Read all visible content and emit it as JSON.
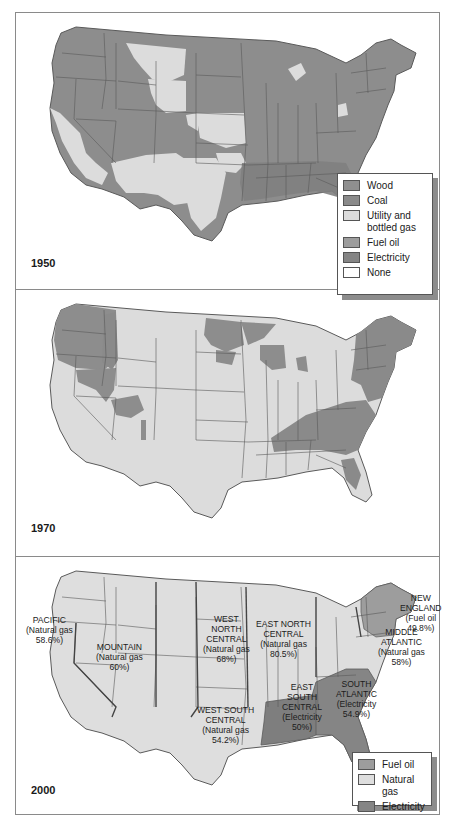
{
  "colors": {
    "wood": "#8f8f8f",
    "coal": "#8a8a8a",
    "utility_bottled_gas": "#dcdcdc",
    "fuel_oil": "#9d9d9d",
    "electricity": "#858585",
    "none": "#ffffff",
    "natural_gas": "#dedede",
    "border": "#5a5a5a"
  },
  "panels": [
    {
      "year": "1950",
      "legend": [
        {
          "label": "Wood",
          "key": "wood"
        },
        {
          "label": "Coal",
          "key": "coal"
        },
        {
          "label": "Utility and bottled gas",
          "key": "utility_bottled_gas"
        },
        {
          "label": "Fuel oil",
          "key": "fuel_oil"
        },
        {
          "label": "Electricity",
          "key": "electricity"
        },
        {
          "label": "None",
          "key": "none"
        }
      ]
    },
    {
      "year": "1970"
    },
    {
      "year": "2000",
      "legend": [
        {
          "label": "Fuel oil",
          "key": "fuel_oil"
        },
        {
          "label": "Natural gas",
          "key": "natural_gas"
        },
        {
          "label": "Electricity",
          "key": "electricity"
        }
      ],
      "regions": [
        {
          "name": "PACIFIC",
          "fuel": "(Natural gas",
          "share": "58.6%)"
        },
        {
          "name": "MOUNTAIN",
          "fuel": "(Natural gas",
          "share": "60%)"
        },
        {
          "name_lines": [
            "WEST",
            "NORTH",
            "CENTRAL"
          ],
          "fuel": "(Natural gas",
          "share": "68%)"
        },
        {
          "name_lines": [
            "EAST NORTH",
            "CENTRAL"
          ],
          "fuel": "(Natural gas",
          "share": "80.5%)"
        },
        {
          "name_lines": [
            "NEW",
            "ENGLAND"
          ],
          "fuel": "(Fuel oil",
          "share": "49.8%)"
        },
        {
          "name_lines": [
            "MIDDLE",
            "ATLANTIC"
          ],
          "fuel": "(Natural gas",
          "share": "58%)"
        },
        {
          "name_lines": [
            "WEST SOUTH",
            "CENTRAL"
          ],
          "fuel": "(Natural gas",
          "share": "54.2%)"
        },
        {
          "name_lines": [
            "EAST",
            "SOUTH",
            "CENTRAL"
          ],
          "fuel": "(Electricity",
          "share": "50%)"
        },
        {
          "name_lines": [
            "SOUTH",
            "ATLANTIC"
          ],
          "fuel": "(Electricity",
          "share": "54.9%)"
        }
      ]
    }
  ]
}
